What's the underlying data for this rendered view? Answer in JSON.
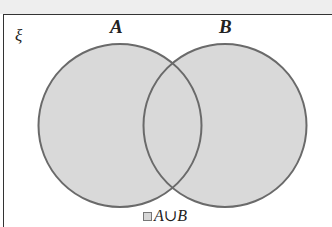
{
  "diagram": {
    "type": "venn",
    "universe_label": "ξ",
    "sets": [
      {
        "label": "A",
        "cx": 120,
        "cy": 125.5,
        "r": 81.5
      },
      {
        "label": "B",
        "cx": 225,
        "cy": 125.5,
        "r": 81.5
      }
    ],
    "shaded_region": "A∪B",
    "colors": {
      "fill": "#d9d9d9",
      "stroke": "#6a6a6a",
      "frame": "#333333"
    }
  },
  "legend": {
    "label": "A∪B"
  }
}
